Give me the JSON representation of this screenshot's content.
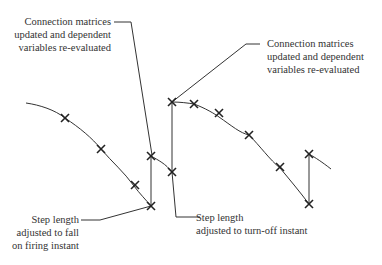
{
  "diagram": {
    "type": "simulation-step-trajectory",
    "annotations": {
      "top_left": {
        "lines": [
          "Connection matrices",
          "updated and dependent",
          "variables re-evaluated"
        ]
      },
      "top_right": {
        "lines": [
          "Connection matrices",
          "updated and dependent",
          "variables re-evaluated"
        ]
      },
      "bottom_left": {
        "lines": [
          "Step length",
          "adjusted to fall",
          "on firing instant"
        ]
      },
      "bottom_middle": {
        "lines": [
          "Step length",
          "adjusted to turn-off instant"
        ]
      }
    },
    "colors": {
      "line": "#333333",
      "marker": "#222222",
      "text": "#333333"
    }
  }
}
